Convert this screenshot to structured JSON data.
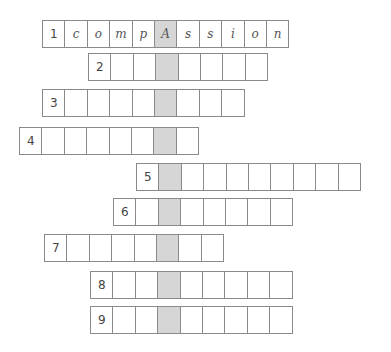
{
  "puzzle": {
    "type": "crossword-acrostic",
    "key_column_color": "#d6d6d6",
    "border_color": "#8a8a8a",
    "rows": [
      {
        "number": "1",
        "x": 42,
        "y": 20,
        "length": 10,
        "key_index": 5,
        "letters": [
          "c",
          "o",
          "m",
          "p",
          "A",
          "s",
          "s",
          "i",
          "o",
          "n"
        ]
      },
      {
        "number": "2",
        "x": 88,
        "y": 53,
        "length": 7,
        "key_index": 3,
        "letters": [
          "",
          "",
          "",
          "",
          "",
          "",
          ""
        ]
      },
      {
        "number": "3",
        "x": 42,
        "y": 89,
        "length": 8,
        "key_index": 5,
        "letters": [
          "",
          "",
          "",
          "",
          "",
          "",
          "",
          ""
        ]
      },
      {
        "number": "4",
        "x": 19,
        "y": 127,
        "length": 7,
        "key_index": 6,
        "letters": [
          "",
          "",
          "",
          "",
          "",
          "",
          ""
        ]
      },
      {
        "number": "5",
        "x": 136,
        "y": 163,
        "length": 9,
        "key_index": 1,
        "letters": [
          "",
          "",
          "",
          "",
          "",
          "",
          "",
          "",
          ""
        ]
      },
      {
        "number": "6",
        "x": 113,
        "y": 198,
        "length": 7,
        "key_index": 2,
        "letters": [
          "",
          "",
          "",
          "",
          "",
          "",
          ""
        ]
      },
      {
        "number": "7",
        "x": 44,
        "y": 234,
        "length": 7,
        "key_index": 5,
        "letters": [
          "",
          "",
          "",
          "",
          "",
          "",
          ""
        ]
      },
      {
        "number": "8",
        "x": 90,
        "y": 271,
        "length": 8,
        "key_index": 3,
        "letters": [
          "",
          "",
          "",
          "",
          "",
          "",
          "",
          ""
        ]
      },
      {
        "number": "9",
        "x": 90,
        "y": 306,
        "length": 8,
        "key_index": 3,
        "letters": [
          "",
          "",
          "",
          "",
          "",
          "",
          "",
          ""
        ]
      }
    ]
  }
}
